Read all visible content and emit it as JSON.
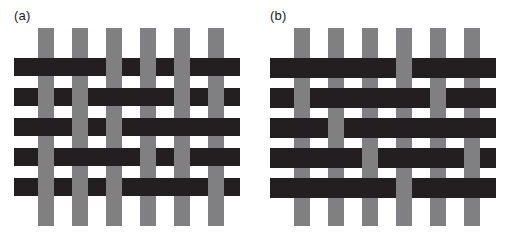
{
  "figure": {
    "background": "#ffffff",
    "panels": [
      {
        "id": "panel-a",
        "label": "(a)",
        "weave_name": "plain-weave-balanced",
        "colors": {
          "warp": "#808083",
          "weft": "#231f20"
        },
        "geometry": {
          "origin_x": 14,
          "origin_y": 28,
          "width": 226,
          "height": 198,
          "warp_count": 6,
          "weft_count": 5,
          "warp_x": [
            24,
            58,
            92,
            126,
            160,
            194
          ],
          "warp_width": 16,
          "warp_top": 0,
          "warp_height": 198,
          "weft_y": [
            30,
            60,
            90,
            120,
            150
          ],
          "weft_height": 18,
          "weft_left": 0,
          "weft_width": 226
        },
        "interlacing": {
          "note": "rows x columns; 1 = weft (dark) passes over warp, 0 = warp (gray) passes over weft",
          "matrix": [
            [
              1,
              1,
              0,
              0,
              0,
              1
            ],
            [
              0,
              0,
              1,
              1,
              0,
              0
            ],
            [
              1,
              0,
              0,
              1,
              1,
              1
            ],
            [
              0,
              1,
              1,
              0,
              0,
              1
            ],
            [
              0,
              0,
              0,
              1,
              1,
              0
            ]
          ]
        }
      },
      {
        "id": "panel-b",
        "label": "(b)",
        "weave_name": "weft-faced-float-weave",
        "colors": {
          "warp": "#808083",
          "weft": "#231f20"
        },
        "geometry": {
          "origin_x": 14,
          "origin_y": 28,
          "width": 226,
          "height": 198,
          "warp_count": 6,
          "weft_count": 5,
          "warp_x": [
            24,
            58,
            92,
            126,
            160,
            194
          ],
          "warp_width": 16,
          "warp_top": 0,
          "warp_height": 198,
          "weft_y": [
            30,
            60,
            90,
            120,
            150
          ],
          "weft_height": 20,
          "weft_left": 0,
          "weft_width": 226
        },
        "interlacing": {
          "note": "rows x columns; 1 = weft (dark) passes over warp, 0 = warp (gray) passes over weft",
          "matrix": [
            [
              1,
              1,
              1,
              0,
              1,
              1
            ],
            [
              0,
              1,
              1,
              1,
              0,
              1
            ],
            [
              1,
              0,
              1,
              1,
              1,
              1
            ],
            [
              1,
              1,
              0,
              1,
              1,
              0
            ],
            [
              1,
              1,
              1,
              0,
              1,
              1
            ]
          ]
        }
      }
    ]
  }
}
